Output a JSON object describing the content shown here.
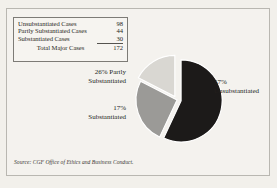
{
  "figure": {
    "background_color": "#f2f0eb",
    "frame_color": "#b9b7b1"
  },
  "legend": {
    "rows": [
      {
        "label": "Unsubstantiated Cases",
        "value": "98"
      },
      {
        "label": "Partly Substantiated Cases",
        "value": "44"
      },
      {
        "label": "Substantiated Cases",
        "value": "30"
      }
    ],
    "total": {
      "label": "Total Major Cases",
      "value": "172"
    }
  },
  "callouts": {
    "unsubstantiated": {
      "pct": "57%",
      "name": "Unsubstantiated"
    },
    "partly": {
      "pct": "26% Partly",
      "name": "Substantiated"
    },
    "substantiated": {
      "pct": "17%",
      "name": "Substantiated"
    }
  },
  "source": "Source: CGF Office of Ethics and Business Conduct.",
  "chart_data": {
    "type": "pie",
    "title": "",
    "xlabel": "",
    "ylabel": "",
    "legend_position": "top-left-table",
    "grid": false,
    "total": 172,
    "categories": [
      "Unsubstantiated",
      "Partly Substantiated",
      "Substantiated"
    ],
    "values": [
      98,
      44,
      30
    ],
    "percentages": [
      57,
      26,
      17
    ],
    "colors": [
      "#1c1a19",
      "#9b9a97",
      "#d9d7d2"
    ],
    "edge_color": "#ffffff",
    "exploded": [
      true,
      false,
      true
    ],
    "annotations": [
      "57% Unsubstantiated",
      "26% Partly Substantiated",
      "17% Substantiated"
    ]
  }
}
